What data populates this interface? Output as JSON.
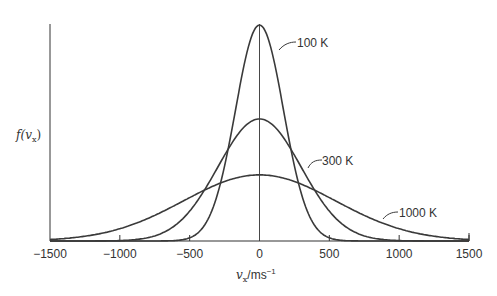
{
  "chart_data": {
    "type": "line",
    "title": "",
    "xlabel": "v_x / m s^-1",
    "ylabel": "f(v_x)",
    "xlim": [
      -1500,
      1500
    ],
    "ylim": [
      0,
      1
    ],
    "x_ticks": [
      -1500,
      -1000,
      -500,
      0,
      500,
      1000,
      1500
    ],
    "x_tick_labels": [
      "−1500",
      "−1000",
      "−500",
      "0",
      "500",
      "1000",
      "1500"
    ],
    "y_ticks": [],
    "grid": false,
    "legend": "inline curve labels",
    "center_line_at_x": 0,
    "series": [
      {
        "name": "100 K",
        "temperature_K": 100,
        "peak_relative": 1.0,
        "sigma_ms": 172
      },
      {
        "name": "300 K",
        "temperature_K": 300,
        "peak_relative": 0.565,
        "sigma_ms": 298
      },
      {
        "name": "1000 K",
        "temperature_K": 1000,
        "peak_relative": 0.306,
        "sigma_ms": 545
      }
    ]
  },
  "labels": {
    "curve_100": "100 K",
    "curve_300": "300 K",
    "curve_1000": "1000 K",
    "ylabel_f": "f(",
    "ylabel_v": "v",
    "ylabel_sub": "x",
    "ylabel_close": ")",
    "xlabel_v": "v",
    "xlabel_sub": "x",
    "xlabel_unit": "/ms",
    "xlabel_exp": "−1"
  },
  "style": {
    "curve_color": "#3a3a3a",
    "axis_color": "#333333"
  }
}
